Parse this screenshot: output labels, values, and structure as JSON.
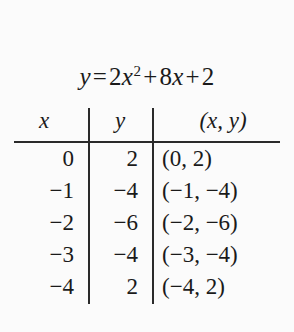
{
  "equation": {
    "lhs": "y",
    "equals": "=",
    "coefficient_a": "2",
    "variable": "x",
    "exponent": "2",
    "plus_1": "+",
    "coefficient_b": "8",
    "variable_b": "x",
    "plus_2": "+",
    "constant": "2",
    "full_text": "y = 2x² + 8x + 2"
  },
  "table": {
    "headers": {
      "x": "x",
      "y": "y",
      "xy": "(x, y)"
    },
    "rows": [
      {
        "x": "0",
        "y": "2",
        "xy": "(0, 2)"
      },
      {
        "x": "−1",
        "y": "−4",
        "xy": "(−1, −4)"
      },
      {
        "x": "−2",
        "y": "−6",
        "xy": "(−2, −6)"
      },
      {
        "x": "−3",
        "y": "−4",
        "xy": "(−3, −4)"
      },
      {
        "x": "−4",
        "y": "2",
        "xy": "(−4, 2)"
      }
    ]
  },
  "colors": {
    "background": "#fbfbfb",
    "text": "#1a1a1a",
    "rule": "#2a2a2a"
  }
}
